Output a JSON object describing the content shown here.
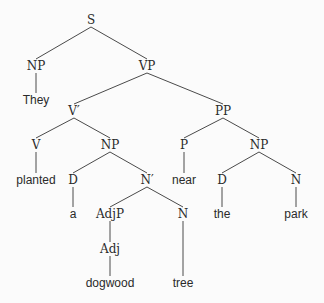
{
  "diagram": {
    "type": "syntax-tree",
    "sentence": "They planted a dogwood tree near the park",
    "line_color": "#4a4a4a",
    "nodes": [
      {
        "id": "S",
        "label": "S",
        "kind": "cat",
        "x": 91,
        "y": 20
      },
      {
        "id": "NP1",
        "label": "NP",
        "kind": "cat",
        "x": 36,
        "y": 66
      },
      {
        "id": "They",
        "label": "They",
        "kind": "word",
        "x": 36,
        "y": 100
      },
      {
        "id": "VP",
        "label": "VP",
        "kind": "cat",
        "x": 147,
        "y": 66
      },
      {
        "id": "Vbar",
        "label": "V′",
        "kind": "cat",
        "x": 74,
        "y": 111
      },
      {
        "id": "PP",
        "label": "PP",
        "kind": "cat",
        "x": 223,
        "y": 111
      },
      {
        "id": "V",
        "label": "V",
        "kind": "cat",
        "x": 36,
        "y": 145
      },
      {
        "id": "NP2",
        "label": "NP",
        "kind": "cat",
        "x": 110,
        "y": 145
      },
      {
        "id": "P",
        "label": "P",
        "kind": "cat",
        "x": 184,
        "y": 145
      },
      {
        "id": "NP3",
        "label": "NP",
        "kind": "cat",
        "x": 259,
        "y": 145
      },
      {
        "id": "planted",
        "label": "planted",
        "kind": "word",
        "x": 36,
        "y": 180
      },
      {
        "id": "D1",
        "label": "D",
        "kind": "cat",
        "x": 73,
        "y": 180
      },
      {
        "id": "Nbar",
        "label": "N′",
        "kind": "cat",
        "x": 147,
        "y": 180
      },
      {
        "id": "near",
        "label": "near",
        "kind": "word",
        "x": 184,
        "y": 180
      },
      {
        "id": "D2",
        "label": "D",
        "kind": "cat",
        "x": 222,
        "y": 180
      },
      {
        "id": "N2",
        "label": "N",
        "kind": "cat",
        "x": 296,
        "y": 180
      },
      {
        "id": "a",
        "label": "a",
        "kind": "word",
        "x": 73,
        "y": 214
      },
      {
        "id": "AdjP",
        "label": "AdjP",
        "kind": "cat",
        "x": 110,
        "y": 214
      },
      {
        "id": "N1",
        "label": "N",
        "kind": "cat",
        "x": 183,
        "y": 214
      },
      {
        "id": "the",
        "label": "the",
        "kind": "word",
        "x": 222,
        "y": 214
      },
      {
        "id": "park",
        "label": "park",
        "kind": "word",
        "x": 296,
        "y": 214
      },
      {
        "id": "Adj",
        "label": "Adj",
        "kind": "cat",
        "x": 110,
        "y": 249
      },
      {
        "id": "dogwood",
        "label": "dogwood",
        "kind": "word",
        "x": 110,
        "y": 283
      },
      {
        "id": "tree",
        "label": "tree",
        "kind": "word",
        "x": 183,
        "y": 283
      }
    ],
    "edges": [
      [
        "S",
        "NP1"
      ],
      [
        "S",
        "VP"
      ],
      [
        "NP1",
        "They"
      ],
      [
        "VP",
        "Vbar"
      ],
      [
        "VP",
        "PP"
      ],
      [
        "Vbar",
        "V"
      ],
      [
        "Vbar",
        "NP2"
      ],
      [
        "V",
        "planted"
      ],
      [
        "NP2",
        "D1"
      ],
      [
        "NP2",
        "Nbar"
      ],
      [
        "D1",
        "a"
      ],
      [
        "Nbar",
        "AdjP"
      ],
      [
        "Nbar",
        "N1"
      ],
      [
        "AdjP",
        "Adj"
      ],
      [
        "Adj",
        "dogwood"
      ],
      [
        "N1",
        "tree"
      ],
      [
        "PP",
        "P"
      ],
      [
        "PP",
        "NP3"
      ],
      [
        "P",
        "near"
      ],
      [
        "NP3",
        "D2"
      ],
      [
        "NP3",
        "N2"
      ],
      [
        "D2",
        "the"
      ],
      [
        "N2",
        "park"
      ]
    ]
  }
}
